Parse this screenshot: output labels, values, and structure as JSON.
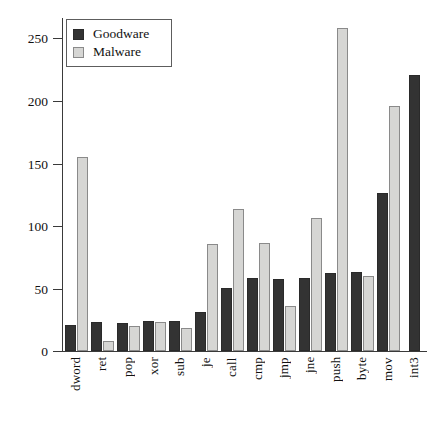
{
  "chart_data": {
    "type": "bar",
    "title": "",
    "subtitle": "",
    "xlabel": "",
    "ylabel": "",
    "ylim": [
      0,
      265
    ],
    "yticks": [
      0,
      50,
      100,
      150,
      200,
      250
    ],
    "ytick_labels": [
      "0",
      "50",
      "100",
      "150",
      "200",
      "250"
    ],
    "grid": false,
    "legend_position": "top-left",
    "categories": [
      "dword",
      "ret",
      "pop",
      "xor",
      "sub",
      "je",
      "call",
      "cmp",
      "jmp",
      "jne",
      "push",
      "byte",
      "mov",
      "int3"
    ],
    "series": [
      {
        "name": "Goodware",
        "color": "#333333",
        "values": [
          21,
          23,
          22,
          24,
          24,
          31,
          50,
          58,
          57,
          58,
          62,
          63,
          126,
          220
        ]
      },
      {
        "name": "Malware",
        "color": "#d6d6d4",
        "values": [
          154,
          8,
          20,
          23,
          18,
          85,
          113,
          86,
          36,
          106,
          257,
          60,
          195,
          0
        ]
      }
    ]
  },
  "legend": {
    "entries": [
      {
        "label": "Goodware",
        "swatch": "goodware-swatch"
      },
      {
        "label": "Malware",
        "swatch": "malware-swatch"
      }
    ]
  },
  "axes": {
    "y_tick_labels": [
      "250",
      "200",
      "150",
      "100",
      "50",
      "0"
    ],
    "x_tick_labels": [
      "dword",
      "ret",
      "pop",
      "xor",
      "sub",
      "je",
      "call",
      "cmp",
      "jmp",
      "jne",
      "push",
      "byte",
      "mov",
      "int3"
    ]
  }
}
